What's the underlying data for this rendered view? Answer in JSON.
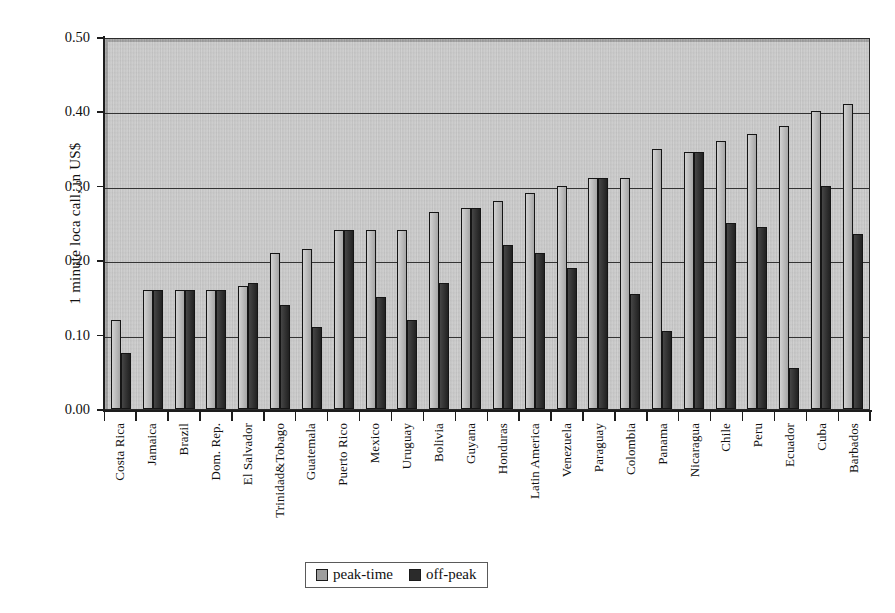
{
  "chart_data": {
    "type": "bar",
    "title": "",
    "xlabel": "",
    "ylabel": "1 minute loca call, in US$",
    "ylim": [
      0.0,
      0.5
    ],
    "ytick_labels": [
      "0.50",
      "0.40",
      "0.30",
      "0.20",
      "0.10",
      "0.00"
    ],
    "ytick_values": [
      0.5,
      0.4,
      0.3,
      0.2,
      0.1,
      0.0
    ],
    "grid": true,
    "legend_position": "bottom-center",
    "categories": [
      "Costa Rica",
      "Jamaica",
      "Brazil",
      "Dom. Rep.",
      "El Salvador",
      "Trinidad&Tobago",
      "Guatemala",
      "Puerto Rico",
      "Mexico",
      "Uruguay",
      "Bolivia",
      "Guyana",
      "Honduras",
      "Latin America",
      "Venezuela",
      "Paraguay",
      "Colombia",
      "Panama",
      "Nicaragua",
      "Chile",
      "Peru",
      "Ecuador",
      "Cuba",
      "Barbados"
    ],
    "series": [
      {
        "name": "peak-time",
        "color": "#b9b9b9",
        "values": [
          0.12,
          0.16,
          0.16,
          0.16,
          0.165,
          0.21,
          0.215,
          0.24,
          0.24,
          0.24,
          0.265,
          0.27,
          0.28,
          0.29,
          0.3,
          0.31,
          0.31,
          0.35,
          0.345,
          0.36,
          0.37,
          0.38,
          0.4,
          0.41
        ]
      },
      {
        "name": "off-peak",
        "color": "#2c2c2c",
        "values": [
          0.075,
          0.16,
          0.16,
          0.16,
          0.17,
          0.14,
          0.11,
          0.24,
          0.15,
          0.12,
          0.17,
          0.27,
          0.22,
          0.21,
          0.19,
          0.31,
          0.155,
          0.105,
          0.345,
          0.25,
          0.245,
          0.055,
          0.3,
          0.235
        ]
      }
    ]
  },
  "legend": {
    "entries": [
      {
        "label": "peak-time",
        "swatch": "light-gray-swatch"
      },
      {
        "label": "off-peak",
        "swatch": "dark-gray-swatch"
      }
    ]
  }
}
